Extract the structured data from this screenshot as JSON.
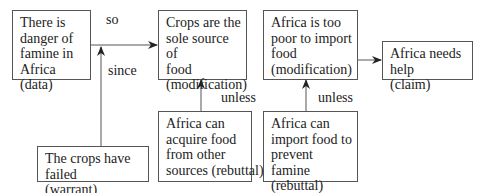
{
  "diagram": {
    "type": "toulmin-argument",
    "nodes": [
      {
        "id": "data",
        "lines": [
          "There is",
          "danger of",
          "famine in",
          "Africa (data)"
        ]
      },
      {
        "id": "mod1",
        "lines": [
          "Crops are the",
          "sole source of",
          "food",
          "(modification)"
        ]
      },
      {
        "id": "mod2",
        "lines": [
          "Africa is too",
          "poor to import",
          "food",
          "(modification)"
        ]
      },
      {
        "id": "claim",
        "lines": [
          "Africa needs help",
          "(claim)"
        ]
      },
      {
        "id": "warrant",
        "lines": [
          "The crops have failed",
          "(warrant)"
        ]
      },
      {
        "id": "rebuttal1",
        "lines": [
          "Africa can",
          "acquire food",
          "from other",
          "sources (rebuttal)"
        ]
      },
      {
        "id": "rebuttal2",
        "lines": [
          "Africa can",
          "import food to",
          "prevent famine",
          "(rebuttal)"
        ]
      }
    ],
    "edge_labels": {
      "so": "so",
      "since": "since",
      "unless1": "unless",
      "unless2": "unless"
    },
    "colors": {
      "stroke": "#555555",
      "text": "#222222",
      "background": "#ffffff"
    }
  }
}
